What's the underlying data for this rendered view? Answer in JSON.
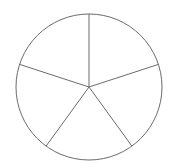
{
  "diagram": {
    "type": "circle-divided-into-segments",
    "segments": 5,
    "center": [
      89,
      87
    ],
    "radius": 73,
    "stroke_color": "#6b6b6b",
    "fill_color": "#ffffff",
    "divider_angles_deg_from_top_clockwise": [
      0,
      72,
      144,
      216,
      288
    ]
  }
}
